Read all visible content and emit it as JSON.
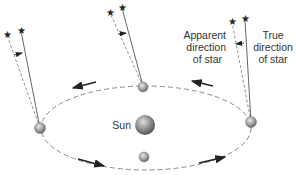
{
  "labels": {
    "sun": "Sun",
    "apparent_line1": "Apparent",
    "apparent_line2": "direction",
    "apparent_line3": "of star",
    "true_line1": "True",
    "true_line2": "direction",
    "true_line3": "of star"
  },
  "icons": {
    "star": "star-icon",
    "planet": "earth-icon",
    "sun": "sun-icon",
    "arrow": "orbit-direction-arrow-icon"
  },
  "colors": {
    "orbit": "#8a8a8a",
    "line": "#555555",
    "body": "#9a9a9a",
    "text": "#333333"
  }
}
